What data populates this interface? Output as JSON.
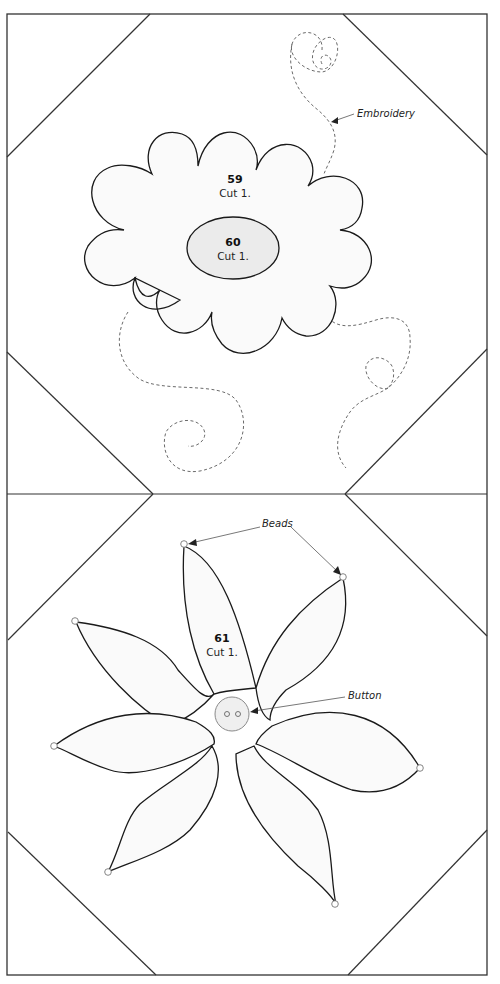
{
  "diagram": {
    "type": "appliqué quilt block pattern",
    "colors": {
      "line": "#333333",
      "piece_fill": "#fafafa",
      "center_fill": "#ebebeb",
      "stitch": "#6a6a6a",
      "button_fill": "#efefef"
    },
    "top_block": {
      "flower_piece": {
        "number": "59",
        "instruction": "Cut 1."
      },
      "center_piece": {
        "number": "60",
        "instruction": "Cut 1."
      },
      "callouts": [
        {
          "label": "Embroidery"
        }
      ]
    },
    "bottom_block": {
      "flower_piece": {
        "number": "61",
        "instruction": "Cut 1."
      },
      "callouts": [
        {
          "label": "Beads"
        },
        {
          "label": "Button"
        }
      ]
    }
  }
}
